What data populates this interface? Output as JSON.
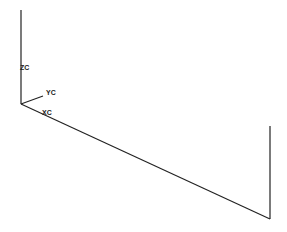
{
  "diagram": {
    "type": "3d-wireframe-axes",
    "axis_labels": {
      "z": "ZC",
      "y": "YC",
      "x": "XC"
    },
    "colors": {
      "background": "#ffffff",
      "line": "#222222"
    }
  }
}
